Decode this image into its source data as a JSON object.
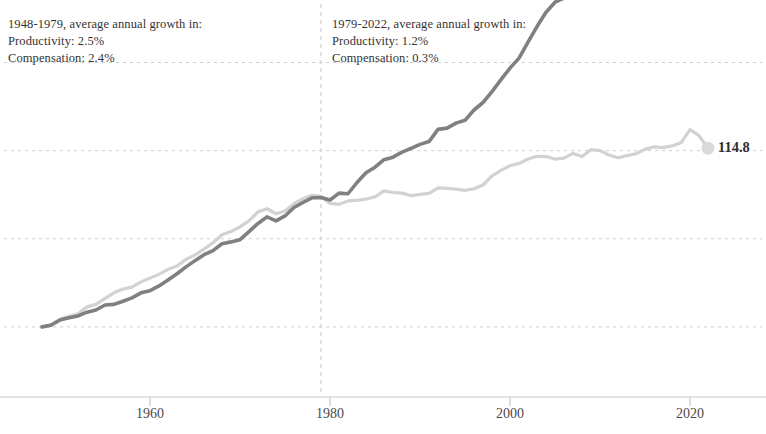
{
  "annotations": {
    "left": {
      "line1": "1948-1979, average annual growth in:",
      "line2": "Productivity: 2.5%",
      "line3": "Compensation: 2.4%"
    },
    "right": {
      "line1": "1979-2022, average annual growth in:",
      "line2": "Productivity: 1.2%",
      "line3": "Compensation: 0.3%"
    }
  },
  "end_labels": {
    "productivity": "164.7",
    "compensation": "114.8"
  },
  "colors": {
    "productivity_line": "#808080",
    "compensation_line": "#d2d2d2",
    "gridline": "#cfcfcf",
    "divider": "#c8c8c8",
    "axis": "#bdbdbd",
    "text": "#333333"
  },
  "chart_data": {
    "type": "line",
    "title": "",
    "subtitle": "",
    "xlabel": "",
    "ylabel": "",
    "xlim": [
      1948,
      2022
    ],
    "ylim": [
      99,
      187
    ],
    "grid": true,
    "gridlines_y": [
      100,
      128.2,
      156.4,
      184.6
    ],
    "legend_position": "end-of-line labels",
    "xticks": [
      1960,
      1980,
      2000,
      2020
    ],
    "xticklabels": [
      "1960",
      "1980",
      "2000",
      "2020"
    ],
    "divider_x": 1979,
    "annotations_text": [
      "1948-1979, average annual growth in: Productivity: 2.5% Compensation: 2.4%",
      "1979-2022, average annual growth in: Productivity: 1.2% Compensation: 0.3%"
    ],
    "x": [
      1948,
      1949,
      1950,
      1951,
      1952,
      1953,
      1954,
      1955,
      1956,
      1957,
      1958,
      1959,
      1960,
      1961,
      1962,
      1963,
      1964,
      1965,
      1966,
      1967,
      1968,
      1969,
      1970,
      1971,
      1972,
      1973,
      1974,
      1975,
      1976,
      1977,
      1978,
      1979,
      1980,
      1981,
      1982,
      1983,
      1984,
      1985,
      1986,
      1987,
      1988,
      1989,
      1990,
      1991,
      1992,
      1993,
      1994,
      1995,
      1996,
      1997,
      1998,
      1999,
      2000,
      2001,
      2002,
      2003,
      2004,
      2005,
      2006,
      2007,
      2008,
      2009,
      2010,
      2011,
      2012,
      2013,
      2014,
      2015,
      2016,
      2017,
      2018,
      2019,
      2020,
      2021,
      2022
    ],
    "series": [
      {
        "name": "Productivity",
        "color": "#808080",
        "end_value": 164.7,
        "values": [
          100.0,
          100.9,
          103.9,
          105.4,
          106.5,
          108.8,
          110.0,
          113.0,
          113.4,
          115.3,
          117.3,
          120.4,
          121.7,
          124.6,
          128.2,
          131.9,
          136.1,
          139.7,
          143.4,
          145.8,
          150.0,
          151.0,
          152.5,
          157.4,
          162.1,
          166.1,
          163.6,
          166.7,
          171.6,
          174.6,
          177.5,
          177.7,
          176.0,
          180.3,
          179.8,
          186.6,
          192.5,
          195.9,
          200.4,
          202.1,
          205.1,
          207.4,
          209.9,
          211.5,
          219.0,
          219.9,
          222.9,
          224.5,
          230.8,
          235.4,
          241.8,
          249.0,
          256.0,
          262.1,
          271.7,
          281.2,
          289.9,
          295.9,
          298.4,
          302.6,
          302.6,
          312.6,
          322.3,
          322.4,
          324.2,
          325.6,
          327.2,
          329.4,
          329.8,
          332.8,
          336.8,
          341.4,
          352.0,
          354.6,
          349.5
        ],
        "index_values": [
          100.0,
          100.5,
          102.2,
          102.9,
          103.5,
          104.7,
          105.4,
          107.0,
          107.2,
          108.2,
          109.3,
          110.9,
          111.6,
          113.1,
          115.0,
          117.0,
          119.2,
          121.2,
          123.1,
          124.4,
          126.6,
          127.2,
          127.9,
          130.5,
          133.1,
          135.2,
          133.9,
          135.5,
          138.2,
          139.8,
          141.3,
          141.4,
          140.6,
          142.8,
          142.6,
          146.2,
          149.3,
          151.1,
          153.5,
          154.3,
          155.9,
          157.1,
          158.4,
          159.3,
          163.2,
          163.6,
          165.2,
          166.1,
          169.4,
          171.8,
          175.3,
          179.1,
          182.8,
          186.0,
          191.1,
          196.1,
          200.7,
          203.9,
          205.2,
          207.4,
          207.4,
          212.7,
          217.8,
          217.9,
          218.8,
          219.6,
          220.4,
          221.6,
          221.8,
          223.4,
          225.5,
          228.0,
          233.6,
          235.0,
          232.3
        ]
      },
      {
        "name": "Compensation",
        "color": "#d2d2d2",
        "end_value": 114.8,
        "values": [
          100.0,
          101.2,
          104.4,
          106.1,
          107.7,
          111.7,
          113.2,
          116.7,
          120.2,
          122.4,
          123.4,
          126.6,
          129.0,
          131.2,
          134.2,
          136.4,
          140.3,
          143.0,
          146.6,
          150.2,
          155.0,
          157.0,
          159.7,
          163.3,
          168.6,
          170.6,
          167.7,
          169.1,
          173.4,
          176.3,
          178.5,
          177.9,
          173.5,
          173.0,
          175.1,
          175.5,
          176.2,
          177.6,
          181.0,
          180.1,
          179.8,
          178.3,
          179.1,
          179.7,
          183.1,
          182.6,
          182.3,
          181.5,
          182.5,
          184.6,
          190.1,
          193.4,
          196.2,
          197.6,
          200.1,
          201.8,
          201.6,
          200.2,
          200.7,
          203.4,
          201.6,
          205.6,
          205.0,
          202.4,
          200.8,
          202.0,
          203.2,
          205.7,
          207.2,
          206.9,
          207.8,
          209.6,
          217.5,
          214.0,
          206.6
        ],
        "index_values": [
          100.0,
          100.7,
          102.4,
          103.4,
          104.2,
          106.4,
          107.2,
          109.1,
          110.9,
          112.1,
          112.7,
          114.4,
          115.6,
          116.8,
          118.4,
          119.5,
          121.6,
          123.0,
          124.9,
          126.9,
          129.5,
          130.5,
          132.0,
          133.9,
          136.8,
          137.8,
          136.2,
          137.1,
          139.4,
          141.0,
          142.1,
          141.8,
          139.5,
          139.2,
          140.3,
          140.5,
          140.9,
          141.6,
          143.5,
          143.0,
          142.8,
          142.0,
          142.4,
          142.7,
          144.5,
          144.3,
          144.1,
          143.7,
          144.2,
          145.4,
          148.3,
          150.1,
          151.6,
          152.3,
          153.7,
          154.6,
          154.5,
          153.7,
          154.0,
          155.5,
          154.5,
          156.7,
          156.4,
          155.0,
          154.1,
          154.8,
          155.4,
          156.8,
          157.6,
          157.4,
          157.9,
          158.9,
          163.1,
          161.2,
          157.2
        ]
      }
    ]
  }
}
